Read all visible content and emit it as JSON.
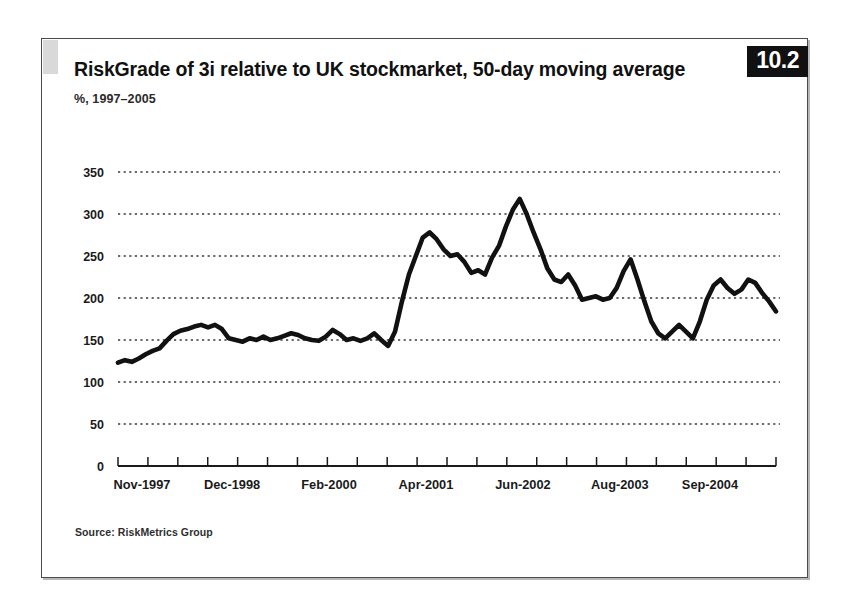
{
  "figure": {
    "badge_number": "10.2",
    "title": "RiskGrade of 3i relative to UK stockmarket, 50-day moving average",
    "subtitle": "%, 1997–2005",
    "source": "Source: RiskMetrics Group",
    "line_color": "#111111",
    "gridline_color": "#3a3a3a",
    "axis_color": "#1a1a1a"
  },
  "chart_data": {
    "type": "line",
    "title": "RiskGrade of 3i relative to UK stockmarket, 50-day moving average",
    "subtitle": "%, 1997–2005",
    "xlabel": "",
    "ylabel": "%",
    "ylim": [
      0,
      350
    ],
    "ytick_values": [
      0,
      50,
      100,
      150,
      200,
      250,
      300,
      350
    ],
    "ytick_labels": [
      "0",
      "50",
      "100",
      "150",
      "200",
      "250",
      "300",
      "350"
    ],
    "grid": true,
    "grid_axis": "y",
    "legend": false,
    "xtick_labels": [
      "Nov-1997",
      "Dec-1998",
      "Feb-2000",
      "Apr-2001",
      "Jun-2002",
      "Aug-2003",
      "Sep-2004"
    ],
    "xtick_positions": [
      0,
      13,
      27,
      41,
      55,
      69,
      82
    ],
    "xminor_tick_count": 22,
    "x_index_range": [
      0,
      95
    ],
    "series": [
      {
        "name": "RiskGrade of 3i relative to UK stockmarket",
        "values": [
          123,
          126,
          124,
          128,
          133,
          137,
          140,
          149,
          157,
          161,
          163,
          166,
          168,
          165,
          168,
          163,
          152,
          150,
          148,
          152,
          150,
          154,
          150,
          152,
          155,
          158,
          156,
          152,
          150,
          149,
          154,
          162,
          157,
          150,
          152,
          149,
          152,
          158,
          150,
          143,
          160,
          196,
          228,
          250,
          272,
          278,
          270,
          258,
          250,
          252,
          243,
          230,
          233,
          228,
          248,
          262,
          285,
          305,
          318,
          300,
          278,
          258,
          235,
          222,
          219,
          228,
          215,
          198,
          200,
          202,
          198,
          200,
          212,
          232,
          246,
          222,
          196,
          172,
          158,
          152,
          160,
          168,
          160,
          152,
          172,
          198,
          215,
          222,
          212,
          205,
          210,
          222,
          218,
          206,
          196,
          184
        ]
      }
    ]
  }
}
